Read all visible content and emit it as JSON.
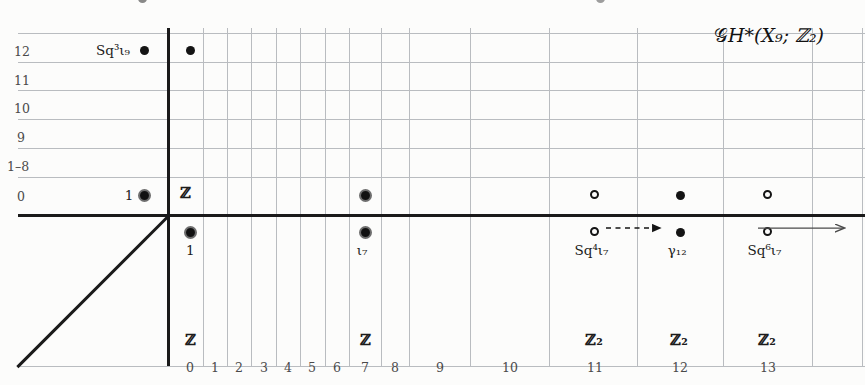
{
  "title": {
    "text": "ᵊ2H*(X₉; ℤ₂)",
    "parts": {
      "script_g": "𝒢",
      "h_star": "H*",
      "arg": "(X₉; ℤ₂)"
    }
  },
  "axes": {
    "x_ticks": [
      "0",
      "1",
      "2",
      "3",
      "4",
      "5",
      "6",
      "7",
      "8",
      "9",
      "10",
      "11",
      "12",
      "13"
    ],
    "y_ticks": [
      "12",
      "11",
      "10",
      "9",
      "1–8",
      "0"
    ],
    "x_axis_label": "",
    "y_axis_label": ""
  },
  "bottom_groups": [
    {
      "column": "0",
      "label": "ℤ"
    },
    {
      "column": "7",
      "label": "ℤ"
    },
    {
      "column": "11",
      "label": "ℤ₂"
    },
    {
      "column": "12",
      "label": "ℤ₂"
    },
    {
      "column": "13",
      "label": "ℤ₂"
    }
  ],
  "row_zero_group": {
    "column": "0",
    "label": "ℤ"
  },
  "markers": {
    "row12": [
      {
        "id": "sq3-iota9-outside",
        "column": "-1",
        "style": "filled",
        "label": "Sq³ι₉",
        "label_pos": "left"
      },
      {
        "id": "row12-col0",
        "column": "0",
        "style": "filled",
        "label": "",
        "label_pos": "none"
      }
    ],
    "row0": [
      {
        "id": "one-outside",
        "column": "-1",
        "style": "ringdot",
        "label": "1",
        "label_pos": "left"
      },
      {
        "id": "col7-above",
        "column": "7",
        "style": "ringdot",
        "label": "",
        "label_pos": "none"
      },
      {
        "id": "col11-above",
        "column": "11",
        "style": "open",
        "label": "",
        "label_pos": "none"
      },
      {
        "id": "col12-above",
        "column": "12",
        "style": "filled",
        "label": "",
        "label_pos": "none"
      },
      {
        "id": "col13-above",
        "column": "13",
        "style": "open",
        "label": "",
        "label_pos": "none"
      }
    ],
    "below_axis": [
      {
        "id": "col0-below",
        "column": "0",
        "style": "ringdot",
        "label": "1",
        "label_pos": "below"
      },
      {
        "id": "col7-below",
        "column": "7",
        "style": "ringdot",
        "label": "ι₇",
        "label_pos": "below"
      },
      {
        "id": "col11-below",
        "column": "11",
        "style": "open",
        "label": "Sq⁴ι₇",
        "label_pos": "below"
      },
      {
        "id": "col12-below",
        "column": "12",
        "style": "filled",
        "label": "γ₁₂",
        "label_pos": "below"
      },
      {
        "id": "col13-below",
        "column": "13",
        "style": "open",
        "label": "Sq⁶ι₇",
        "label_pos": "below"
      }
    ]
  },
  "labels": {
    "sq3_iota9": "Sq³ι₉",
    "one_left": "1",
    "one_below": "1",
    "iota7": "ι₇",
    "sq4_iota7": "Sq⁴ι₇",
    "gamma12": "γ₁₂",
    "sq6_iota7": "Sq⁶ι₇",
    "z": "ℤ",
    "z2": "ℤ₂"
  },
  "connections": [
    {
      "id": "differential-11-to-12",
      "from": "col11-below",
      "to": "col12-below",
      "style": "dashed",
      "arrow": true
    },
    {
      "id": "continuation-arrow",
      "from": "col13-below",
      "to": "right-edge",
      "style": "solid",
      "arrow": true
    }
  ],
  "colors": {
    "ink": "#141414",
    "grid": "#b9bcc0",
    "axis": "#1a1a1a",
    "paper": "#fcfcfb",
    "muted": "#4a4a4a"
  }
}
